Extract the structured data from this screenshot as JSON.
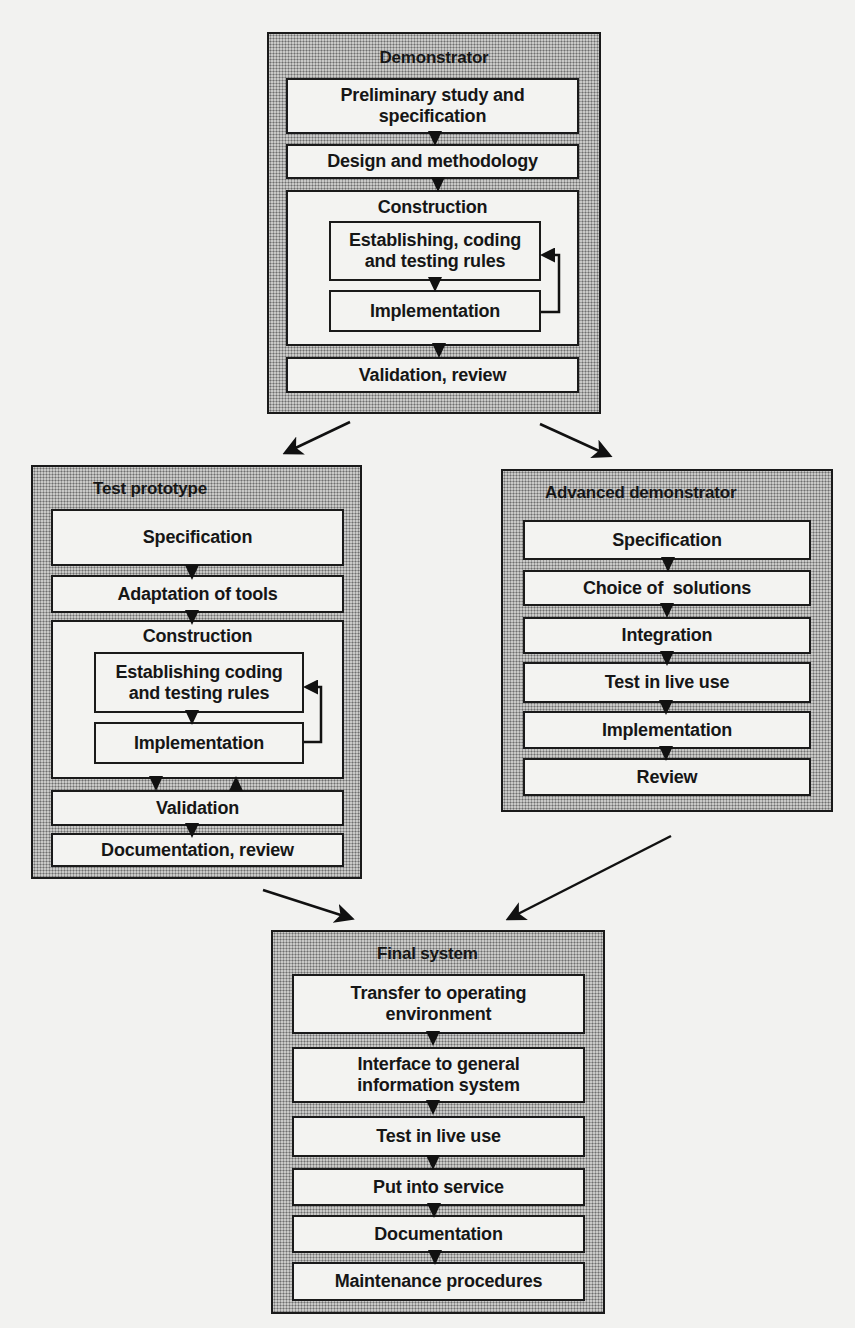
{
  "diagram": {
    "demonstrator": {
      "title": "Demonstrator",
      "steps": [
        "Preliminary study and specification",
        "Design and methodology",
        "Construction",
        "Validation, review"
      ],
      "construction_substeps": [
        "Establishing, coding and testing rules",
        "Implementation"
      ]
    },
    "test_prototype": {
      "title": "Test prototype",
      "steps": [
        "Specification",
        "Adaptation of tools",
        "Construction",
        "Validation",
        "Documentation, review"
      ],
      "construction_substeps": [
        "Establishing coding and testing rules",
        "Implementation"
      ]
    },
    "advanced_demonstrator": {
      "title": "Advanced demonstrator",
      "steps": [
        "Specification",
        "Choice of  solutions",
        "Integration",
        "Test in live use",
        "Implementation",
        "Review"
      ]
    },
    "final_system": {
      "title": "Final system",
      "steps": [
        "Transfer to operating environment",
        "Interface to general information system",
        "Test in live use",
        "Put into service",
        "Documentation",
        "Maintenance procedures"
      ]
    },
    "connections": [
      {
        "from": "Demonstrator",
        "to": "Test prototype"
      },
      {
        "from": "Demonstrator",
        "to": "Advanced demonstrator"
      },
      {
        "from": "Test prototype",
        "to": "Final system"
      },
      {
        "from": "Advanced demonstrator",
        "to": "Final system"
      }
    ]
  }
}
